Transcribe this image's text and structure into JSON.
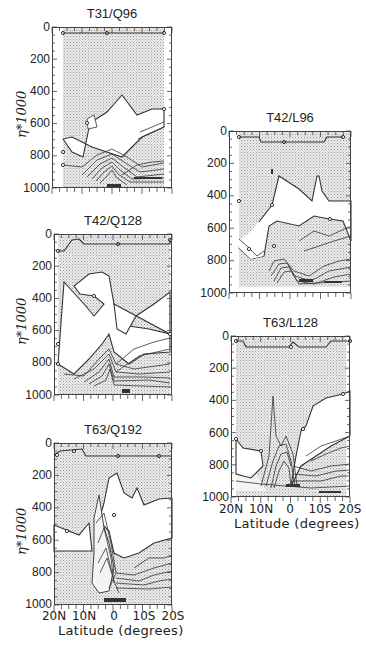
{
  "figure": {
    "ylabel": "η*1000",
    "xlabel": "Latitude (degrees)",
    "yticks": [
      "0",
      "200",
      "400",
      "600",
      "800",
      "1000"
    ],
    "xticks": [
      "20N",
      "10N",
      "0",
      "10S",
      "20S"
    ],
    "colors": {
      "shade": "#cfcfcf",
      "line": "#333333",
      "frame": "#444444",
      "background": "#ffffff"
    }
  },
  "panels": [
    {
      "title": "T31/Q96"
    },
    {
      "title": "T42/Q128"
    },
    {
      "title": "T63/Q192"
    },
    {
      "title": "T42/L96"
    },
    {
      "title": "T63/L128"
    }
  ],
  "chart_data": [
    {
      "type": "heatmap",
      "title": "T31/Q96",
      "xlabel": "",
      "ylabel": "η*1000",
      "x": [
        "20N",
        "10N",
        "0",
        "10S",
        "20S"
      ],
      "ylim": [
        1000,
        0
      ],
      "yticks": [
        0,
        200,
        400,
        600,
        800,
        1000
      ],
      "contour_boundary_eta": {
        "upper_shaded_top": 60,
        "cloud_free_region_top_min": 330,
        "low_level_contours_base": 800
      },
      "grid": false
    },
    {
      "type": "heatmap",
      "title": "T42/Q128",
      "xlabel": "",
      "ylabel": "η*1000",
      "x": [
        "20N",
        "10N",
        "0",
        "10S",
        "20S"
      ],
      "ylim": [
        1000,
        0
      ],
      "yticks": [
        0,
        200,
        400,
        600,
        800,
        1000
      ],
      "contour_boundary_eta": {
        "upper_shaded_top": 60,
        "cloud_free_region_top_min": 410,
        "low_level_contours_base": 760
      },
      "grid": false
    },
    {
      "type": "heatmap",
      "title": "T63/Q192",
      "xlabel": "Latitude (degrees)",
      "ylabel": "η*1000",
      "x": [
        "20N",
        "10N",
        "0",
        "10S",
        "20S"
      ],
      "ylim": [
        1000,
        0
      ],
      "yticks": [
        0,
        200,
        400,
        600,
        800,
        1000
      ],
      "contour_boundary_eta": {
        "upper_shaded_top": 60,
        "cloud_free_region_top_min": 360,
        "low_level_contours_base": 530
      },
      "grid": false
    },
    {
      "type": "heatmap",
      "title": "T42/L96",
      "xlabel": "",
      "ylabel": "",
      "x": [
        "20N",
        "10N",
        "0",
        "10S",
        "20S"
      ],
      "ylim": [
        1000,
        0
      ],
      "yticks": [
        0,
        200,
        400,
        600,
        800,
        1000
      ],
      "contour_boundary_eta": {
        "upper_shaded_top": 60,
        "cloud_free_region_top_min": 330,
        "low_level_contours_base": 760
      },
      "grid": false
    },
    {
      "type": "heatmap",
      "title": "T63/L128",
      "xlabel": "Latitude (degrees)",
      "ylabel": "",
      "x": [
        "20N",
        "10N",
        "0",
        "10S",
        "20S"
      ],
      "ylim": [
        1000,
        0
      ],
      "yticks": [
        0,
        200,
        400,
        600,
        800,
        1000
      ],
      "contour_boundary_eta": {
        "upper_shaded_top": 60,
        "cloud_free_region_top_min": 400,
        "low_level_contours_base": 700
      },
      "grid": false
    }
  ]
}
